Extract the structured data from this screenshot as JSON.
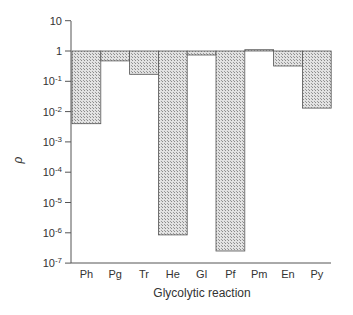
{
  "chart_data": {
    "type": "bar",
    "title": "",
    "xlabel": "Glycolytic reaction",
    "ylabel": "ρ",
    "yscale": "log",
    "ylim": [
      1e-07,
      10
    ],
    "baseline": 1,
    "grid": false,
    "legend": null,
    "categories": [
      "Ph",
      "Pg",
      "Tr",
      "He",
      "Gl",
      "Pf",
      "Pm",
      "En",
      "Py"
    ],
    "values": [
      0.004,
      0.47,
      0.17,
      8.5e-07,
      0.74,
      2.5e-07,
      1.1,
      0.32,
      0.013
    ],
    "y_ticks": [
      {
        "exp": "",
        "base": "10",
        "value": 10
      },
      {
        "exp": "",
        "base": "1",
        "value": 1
      },
      {
        "exp": "-1",
        "base": "10",
        "value": 0.1
      },
      {
        "exp": "-2",
        "base": "10",
        "value": 0.01
      },
      {
        "exp": "-3",
        "base": "10",
        "value": 0.001
      },
      {
        "exp": "-4",
        "base": "10",
        "value": 0.0001
      },
      {
        "exp": "-5",
        "base": "10",
        "value": 1e-05
      },
      {
        "exp": "-6",
        "base": "10",
        "value": 1e-06
      },
      {
        "exp": "-7",
        "base": "10",
        "value": 1e-07
      }
    ],
    "bar_fill": "#c8c8c8",
    "bar_stroke": "#555555"
  }
}
